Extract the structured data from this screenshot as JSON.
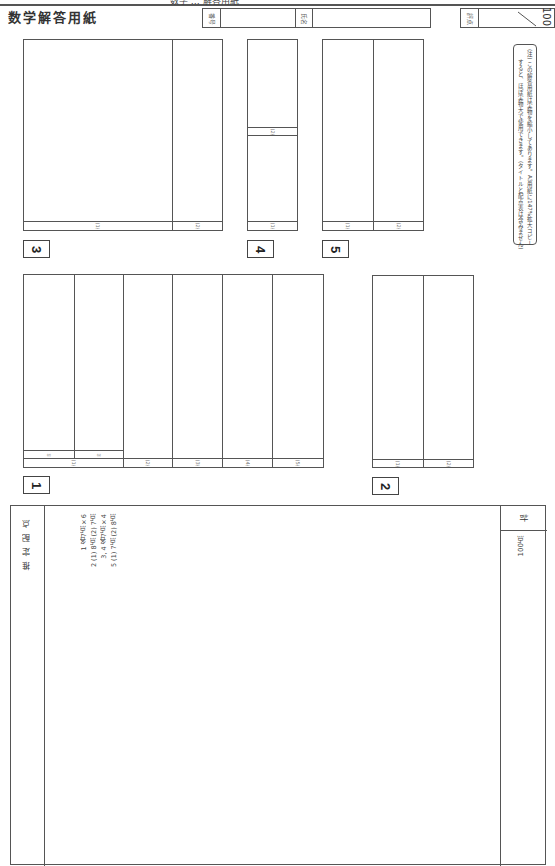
{
  "header": {
    "cut_text": "数学 … 解答用紙",
    "title": "数学解答用紙",
    "number_label": "番号",
    "name_label": "氏名",
    "score_label": "評点",
    "score_max": "100"
  },
  "note": {
    "mark": "(注)",
    "line1": "この解答用紙は実物を縮小してあります。A3用紙に147%拡大コピー",
    "line2": "すると、ほぼ実物大で使用できます。(タイトルと配点表は含みません)"
  },
  "questions": {
    "q1": {
      "number": "1",
      "subs": [
        "(1)",
        "(2)",
        "(3)",
        "(4)",
        "(5)"
      ],
      "sub1_parts": [
        "①",
        "②"
      ]
    },
    "q2": {
      "number": "2",
      "subs": [
        "(1)",
        "(2)"
      ]
    },
    "q3": {
      "number": "3",
      "subs": [
        "(1)",
        "(2)"
      ]
    },
    "q4": {
      "number": "4",
      "subs": [
        "(1)",
        "(2)"
      ]
    },
    "q5": {
      "number": "5",
      "subs": [
        "(1)",
        "(2)"
      ]
    }
  },
  "scoring": {
    "header": "推定配点",
    "lines": [
      "1 各7点×6",
      "2 (1) 8点 (2) 7点",
      "3, 4 各7点×4",
      "5 (1) 7点 (2) 8点"
    ],
    "total_label": "計",
    "total_value": "100点"
  }
}
